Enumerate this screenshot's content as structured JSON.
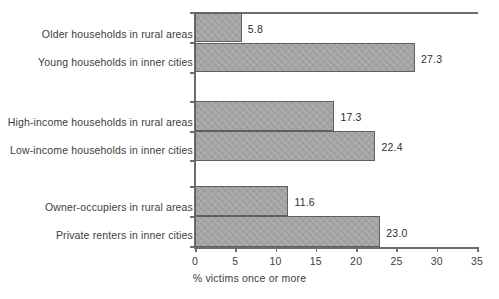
{
  "chart_data": {
    "type": "bar",
    "orientation": "horizontal",
    "title": "",
    "xlabel": "% victims once or more",
    "ylabel": "",
    "xlim": [
      0,
      35
    ],
    "xticks": [
      0,
      5,
      10,
      15,
      20,
      25,
      30,
      35
    ],
    "xtick_labels": [
      "0",
      "5",
      "10",
      "15",
      "20",
      "25",
      "30",
      "35"
    ],
    "grid": false,
    "legend": null,
    "categories": [
      "Older households in rural areas",
      "Young households in inner cities",
      "High-income households in rural areas",
      "Low-income households in inner cities",
      "Owner-occupiers in rural areas",
      "Private renters in inner cities"
    ],
    "values": [
      5.8,
      27.3,
      17.3,
      22.4,
      11.6,
      23.0
    ],
    "value_labels": [
      "5.8",
      "27.3",
      "17.3",
      "22.4",
      "11.6",
      "23.0"
    ],
    "groups": [
      {
        "name": "age-group",
        "categories": [
          0,
          1
        ]
      },
      {
        "name": "income-group",
        "categories": [
          2,
          3
        ]
      },
      {
        "name": "tenure-group",
        "categories": [
          4,
          5
        ]
      }
    ],
    "bar_color": "#a3a3a3",
    "bar_edge_color": "#5f5f5f",
    "axis_color": "#6d6d6d",
    "background": "#ffffff"
  }
}
